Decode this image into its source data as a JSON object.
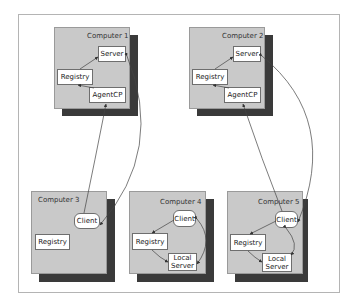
{
  "diagram": {
    "computers": [
      {
        "id": "c1",
        "label": "Computer 1",
        "nodes": [
          {
            "id": "c1-server",
            "label": "Server"
          },
          {
            "id": "c1-registry",
            "label": "Registry"
          },
          {
            "id": "c1-agentcp",
            "label": "AgentCP"
          }
        ]
      },
      {
        "id": "c2",
        "label": "Computer 2",
        "nodes": [
          {
            "id": "c2-server",
            "label": "Server"
          },
          {
            "id": "c2-registry",
            "label": "Registry"
          },
          {
            "id": "c2-agentcp",
            "label": "AgentCP"
          }
        ]
      },
      {
        "id": "c3",
        "label": "Computer 3",
        "nodes": [
          {
            "id": "c3-client",
            "label": "Client"
          },
          {
            "id": "c3-registry",
            "label": "Registry"
          }
        ]
      },
      {
        "id": "c4",
        "label": "Computer 4",
        "nodes": [
          {
            "id": "c4-client",
            "label": "Client"
          },
          {
            "id": "c4-registry",
            "label": "Registry"
          },
          {
            "id": "c4-localserver",
            "label": "Local Server"
          }
        ]
      },
      {
        "id": "c5",
        "label": "Computer 5",
        "nodes": [
          {
            "id": "c5-client",
            "label": "Client"
          },
          {
            "id": "c5-registry",
            "label": "Registry"
          },
          {
            "id": "c5-localserver",
            "label": "Local Server"
          }
        ]
      }
    ],
    "edges": [
      {
        "from": "c1-server",
        "to": "c1-registry"
      },
      {
        "from": "c1-agentcp",
        "to": "c1-registry"
      },
      {
        "from": "c2-server",
        "to": "c2-registry"
      },
      {
        "from": "c2-agentcp",
        "to": "c2-registry"
      },
      {
        "from": "c3-client",
        "to": "c1-agentcp"
      },
      {
        "from": "c1-server",
        "to": "c3-client"
      },
      {
        "from": "c4-client",
        "to": "c4-registry"
      },
      {
        "from": "c4-registry",
        "to": "c4-localserver"
      },
      {
        "from": "c4-client",
        "to": "c4-localserver",
        "bidirectional": true
      },
      {
        "from": "c5-client",
        "to": "c2-agentcp"
      },
      {
        "from": "c2-server",
        "to": "c5-client"
      },
      {
        "from": "c5-client",
        "to": "c5-registry"
      },
      {
        "from": "c5-registry",
        "to": "c5-localserver"
      },
      {
        "from": "c5-client",
        "to": "c5-localserver",
        "bidirectional": true
      }
    ],
    "colors": {
      "computer_fill": "#c9c9c9",
      "shadow": "#3a3a3a",
      "node_fill": "#ffffff",
      "line": "#444444"
    }
  }
}
